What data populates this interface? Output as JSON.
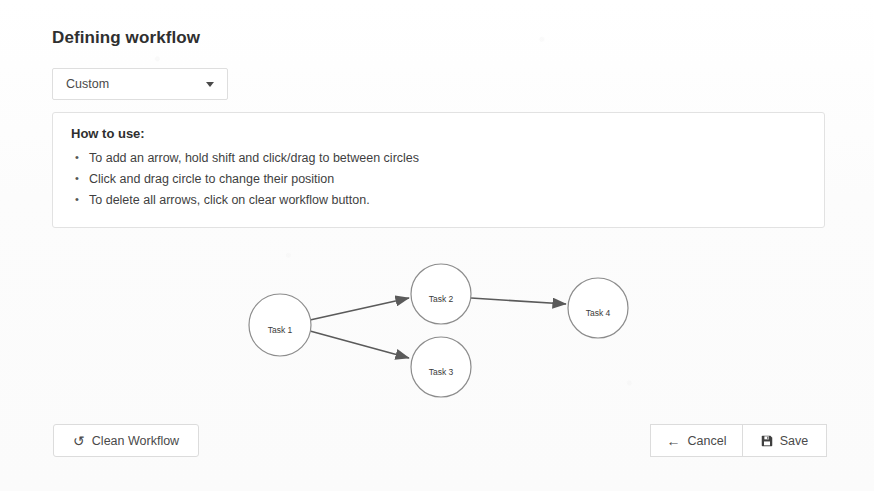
{
  "header": {
    "title": "Defining workflow"
  },
  "workflow_select": {
    "name": "workflow-type-select",
    "value": "Custom",
    "icon": "chevron-down-icon"
  },
  "help": {
    "title": "How to use:",
    "items": [
      "To add an arrow, hold shift and click/drag to between circles",
      "Click and drag circle to change their position",
      "To delete all arrows, click on clear workflow button."
    ]
  },
  "diagram": {
    "nodes": [
      {
        "id": "task1",
        "label": "Task 1",
        "cx": 280,
        "cy": 85,
        "r": 31
      },
      {
        "id": "task2",
        "label": "Task 2",
        "cx": 441,
        "cy": 54,
        "r": 30
      },
      {
        "id": "task3",
        "label": "Task 3",
        "cx": 441,
        "cy": 127,
        "r": 30
      },
      {
        "id": "task4",
        "label": "Task 4",
        "cx": 598,
        "cy": 68,
        "r": 30
      }
    ],
    "edges": [
      {
        "from": "task1",
        "to": "task2"
      },
      {
        "from": "task1",
        "to": "task3"
      },
      {
        "from": "task2",
        "to": "task4"
      }
    ],
    "colors": {
      "node_stroke": "#8c8c8c",
      "node_fill": "#ffffff",
      "edge": "#5a5a5a"
    }
  },
  "buttons": {
    "clean_workflow": {
      "label": "Clean Workflow",
      "icon": "undo-icon"
    },
    "cancel": {
      "label": "Cancel",
      "icon": "arrow-left-icon"
    },
    "save": {
      "label": "Save",
      "icon": "floppy-disk-icon"
    }
  }
}
